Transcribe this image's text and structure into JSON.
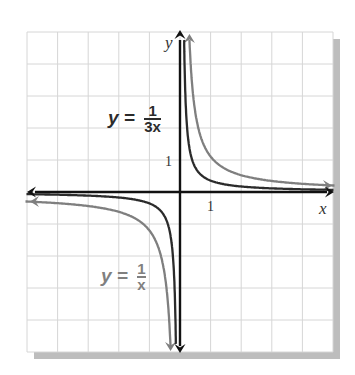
{
  "chart_data": {
    "type": "line",
    "title": "",
    "xlabel": "x",
    "ylabel": "y",
    "xlim": [
      -5,
      5
    ],
    "ylim": [
      -5,
      5
    ],
    "grid": true,
    "tick_labels": {
      "x": [
        "1"
      ],
      "y": [
        "1"
      ]
    },
    "series": [
      {
        "name": "y = 1/x",
        "expression": "1/x",
        "k": 1,
        "color": "#7f7f7f"
      },
      {
        "name": "y = 1/(3x)",
        "expression": "1/(3x)",
        "k": 0.3333,
        "color": "#2b2b2b"
      }
    ],
    "annotations": [
      {
        "text": "y = 1/(3x)",
        "position": "upper-left of first-quadrant branch"
      },
      {
        "text": "y = 1/x",
        "position": "lower-left near third-quadrant branch"
      }
    ]
  },
  "labels": {
    "y_axis": "y",
    "x_axis": "x",
    "x_tick": "1",
    "y_tick": "1",
    "eq1": {
      "lhs": "y =",
      "num": "1",
      "den": "3x",
      "color": "#2b2b2b"
    },
    "eq2": {
      "lhs": "y =",
      "num": "1",
      "den": "x",
      "color": "#808080"
    }
  },
  "layout": {
    "grid_left": 27,
    "grid_top": 32,
    "grid_right": 333,
    "grid_bottom": 352,
    "origin_x": 180,
    "origin_y": 192,
    "unit_x": 30.6,
    "unit_y": 32,
    "grid_color": "#d6d6d6",
    "shadow_color": "#bdbdbd",
    "axis_color": "#111111"
  }
}
